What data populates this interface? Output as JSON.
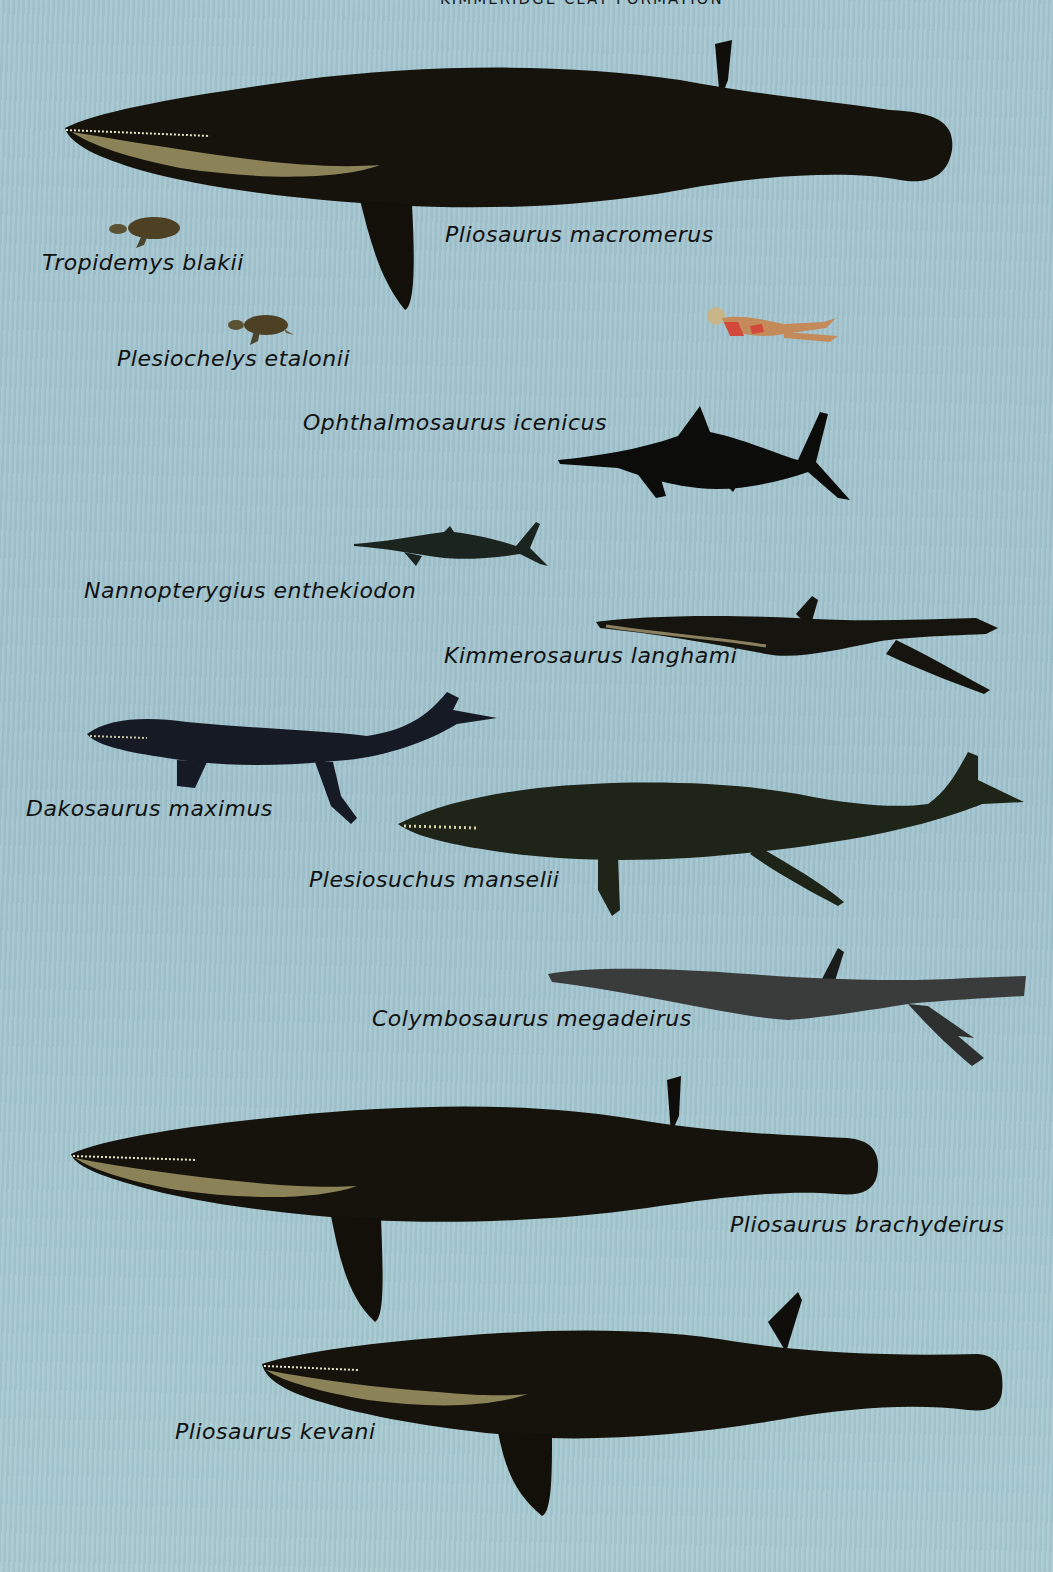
{
  "title": {
    "text": "KIMMERIDGE CLAY FORMATION",
    "note": "cropped at top edge"
  },
  "background_color": "#9fc3cd",
  "creatures": [
    {
      "id": "pliosaurus-macromerus",
      "label": "Pliosaurus macromerus",
      "color": "#14120c"
    },
    {
      "id": "tropidemys-blakii",
      "label": "Tropidemys blakii",
      "color": "#4a3e22"
    },
    {
      "id": "plesiochelys-etalonii",
      "label": "Plesiochelys etalonii",
      "color": "#4a3e22"
    },
    {
      "id": "human-swimmer",
      "label": "",
      "color": "#d2483a"
    },
    {
      "id": "ophthalmosaurus-icenicus",
      "label": "Ophthalmosaurus icenicus",
      "color": "#0d0d0b"
    },
    {
      "id": "nannopterygius-enthekiodon",
      "label": "Nannopterygius enthekiodon",
      "color": "#1c2420"
    },
    {
      "id": "kimmerosaurus-langhami",
      "label": "Kimmerosaurus langhami",
      "color": "#16140e"
    },
    {
      "id": "dakosaurus-maximus",
      "label": "Dakosaurus maximus",
      "color": "#151a24"
    },
    {
      "id": "plesiosuchus-manselii",
      "label": "Plesiosuchus manselii",
      "color": "#1e2418"
    },
    {
      "id": "colymbosaurus-megadeirus",
      "label": "Colymbosaurus megadeirus",
      "color": "#3a3c3c"
    },
    {
      "id": "pliosaurus-brachydeirus",
      "label": "Pliosaurus brachydeirus",
      "color": "#14120c"
    },
    {
      "id": "pliosaurus-kevani",
      "label": "Pliosaurus kevani",
      "color": "#14120c"
    }
  ]
}
